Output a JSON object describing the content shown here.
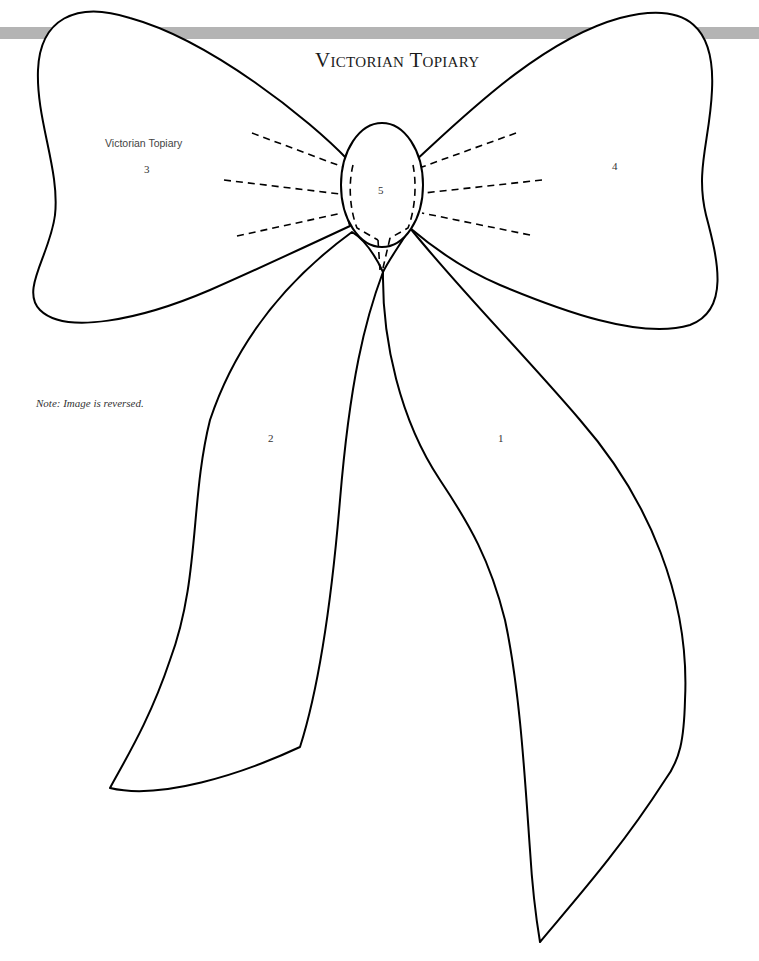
{
  "header": {
    "title": "Victorian Topiary",
    "bar_color": "#b4b4b4"
  },
  "pattern": {
    "pieces": [
      {
        "number": "1",
        "name": "right-streamer"
      },
      {
        "number": "2",
        "name": "left-streamer"
      },
      {
        "number": "3",
        "name": "left-loop",
        "caption": "Victorian Topiary"
      },
      {
        "number": "4",
        "name": "right-loop"
      },
      {
        "number": "5",
        "name": "knot"
      }
    ],
    "note": "Note: Image is reversed.",
    "line_color": "#000000"
  }
}
